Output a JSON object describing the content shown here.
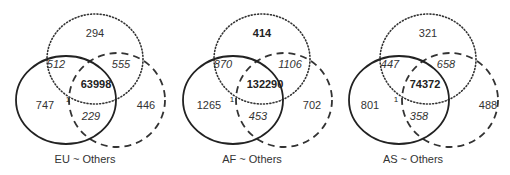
{
  "figure": {
    "panels": [
      {
        "caption": "EU ~ Others",
        "regions": {
          "dotted_only": "294",
          "solid_dotted": "512",
          "dotted_dashed": "555",
          "all_three": "63998",
          "solid_only": "747",
          "dashed_only": "446",
          "solid_dashed": "229",
          "small_marker": "1"
        },
        "bold_regions": [
          "all_three"
        ]
      },
      {
        "caption": "AF ~ Others",
        "regions": {
          "dotted_only": "414",
          "solid_dotted": "870",
          "dotted_dashed": "1106",
          "all_three": "132290",
          "solid_only": "1265",
          "dashed_only": "702",
          "solid_dashed": "453",
          "small_marker": "1"
        },
        "bold_regions": [
          "all_three",
          "dotted_only"
        ]
      },
      {
        "caption": "AS ~ Others",
        "regions": {
          "dotted_only": "321",
          "solid_dotted": "447",
          "dotted_dashed": "658",
          "all_three": "74372",
          "solid_only": "801",
          "dashed_only": "488",
          "solid_dashed": "358",
          "small_marker": "1"
        },
        "bold_regions": [
          "all_three"
        ]
      }
    ],
    "legend_styles": {
      "solid_circle": "solid",
      "dotted_circle": "dotted",
      "dashed_circle": "dashed"
    },
    "colors": {
      "stroke": "#222222",
      "text": "#333333",
      "background": "#ffffff"
    }
  }
}
